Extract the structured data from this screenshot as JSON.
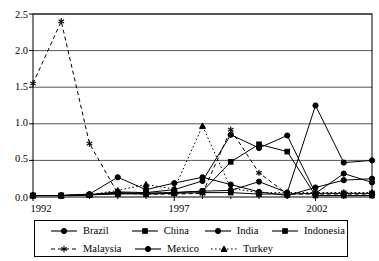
{
  "chart_data": {
    "type": "line",
    "title": "",
    "xlabel": "",
    "ylabel": "",
    "xlim": [
      1992,
      2004
    ],
    "ylim": [
      0.0,
      2.5
    ],
    "ytick_labels": [
      "0.0",
      "0.5",
      "1.0",
      "1.5",
      "2.0",
      "2.5"
    ],
    "ytick_values": [
      0.0,
      0.5,
      1.0,
      1.5,
      2.0,
      2.5
    ],
    "xtick_labels": [
      "1992",
      "1997",
      "2002"
    ],
    "xtick_values": [
      1992,
      1997,
      2002
    ],
    "grid": "horizontal",
    "legend_position": "bottom",
    "x": [
      1992,
      1993,
      1994,
      1995,
      1996,
      1997,
      1998,
      1999,
      2000,
      2001,
      2002,
      2003,
      2004
    ],
    "series": [
      {
        "name": "Brazil",
        "marker": "filled-circle",
        "linestyle": "solid",
        "color": "#000000",
        "values": [
          0.02,
          0.02,
          0.04,
          0.27,
          0.1,
          0.19,
          0.27,
          0.17,
          0.07,
          0.02,
          0.13,
          0.23,
          0.25
        ]
      },
      {
        "name": "China",
        "marker": "filled-square",
        "linestyle": "solid",
        "color": "#000000",
        "values": [
          0.02,
          0.02,
          0.03,
          0.04,
          0.05,
          0.06,
          0.08,
          0.48,
          0.72,
          0.62,
          0.02,
          0.02,
          0.02
        ]
      },
      {
        "name": "India",
        "marker": "filled-circle",
        "linestyle": "solid",
        "color": "#000000",
        "values": [
          0.02,
          0.02,
          0.03,
          0.07,
          0.06,
          0.1,
          0.22,
          0.85,
          0.67,
          0.84,
          0.05,
          0.32,
          0.2
        ]
      },
      {
        "name": "Indonesia",
        "marker": "filled-square",
        "linestyle": "solid",
        "color": "#000000",
        "values": [
          0.02,
          0.02,
          0.03,
          0.05,
          0.04,
          0.05,
          0.06,
          0.06,
          0.04,
          0.04,
          0.05,
          0.05,
          0.05
        ]
      },
      {
        "name": "Malaysia",
        "marker": "asterisk",
        "linestyle": "dashed",
        "color": "#000000",
        "values": [
          1.55,
          2.4,
          0.73,
          0.05,
          0.04,
          0.04,
          0.05,
          0.92,
          0.33,
          0.04,
          0.04,
          0.04,
          0.04
        ]
      },
      {
        "name": "Mexico",
        "marker": "filled-circle",
        "linestyle": "solid",
        "color": "#000000",
        "values": [
          0.02,
          0.02,
          0.03,
          0.06,
          0.05,
          0.06,
          0.08,
          0.09,
          0.21,
          0.06,
          1.25,
          0.47,
          0.5
        ]
      },
      {
        "name": "Turkey",
        "marker": "filled-triangle",
        "linestyle": "dotted",
        "color": "#000000",
        "values": [
          0.02,
          0.02,
          0.03,
          0.09,
          0.17,
          0.11,
          0.97,
          0.12,
          0.06,
          0.06,
          0.06,
          0.06,
          0.06
        ]
      }
    ]
  },
  "legend": {
    "row1": [
      {
        "label": "Brazil",
        "marker": "filled-circle",
        "linestyle": "solid"
      },
      {
        "label": "China",
        "marker": "filled-square",
        "linestyle": "solid"
      },
      {
        "label": "India",
        "marker": "filled-circle",
        "linestyle": "solid"
      },
      {
        "label": "Indonesia",
        "marker": "filled-square",
        "linestyle": "solid"
      }
    ],
    "row2": [
      {
        "label": "Malaysia",
        "marker": "asterisk",
        "linestyle": "dashed"
      },
      {
        "label": "Mexico",
        "marker": "filled-circle",
        "linestyle": "solid"
      },
      {
        "label": "Turkey",
        "marker": "filled-triangle",
        "linestyle": "dotted"
      }
    ]
  }
}
